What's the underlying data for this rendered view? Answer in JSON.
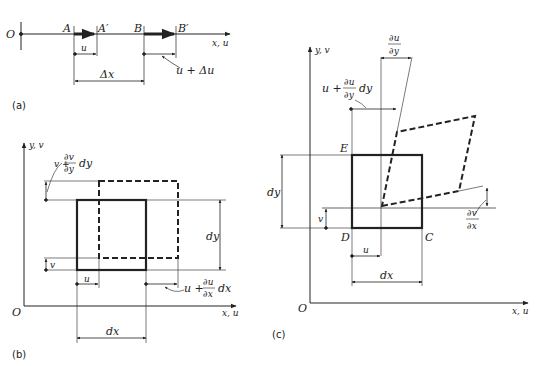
{
  "figure": {
    "panel_a": {
      "caption": "(a)",
      "origin": "O",
      "axis": "x, u",
      "points": [
        "A",
        "A′",
        "B",
        "B′"
      ],
      "disp_u": "u",
      "disp_u_du": "u + Δu",
      "delta_x": "Δx"
    },
    "panel_b": {
      "caption": "(b)",
      "origin": "O",
      "x_axis": "x, u",
      "y_axis": "y, v",
      "v_label": "v",
      "u_label": "u",
      "dx": "dx",
      "dy": "dy",
      "v_plus": "v +",
      "dv": "∂v",
      "dy_den": "∂y",
      "dy_tail": "dy",
      "u_plus": "u +",
      "du": "∂u",
      "dx_den": "∂x",
      "dx_tail": "dx"
    },
    "panel_c": {
      "caption": "(c)",
      "origin": "O",
      "x_axis": "x, u",
      "y_axis": "y, v",
      "E": "E",
      "D": "D",
      "C": "C",
      "u_label": "u",
      "v_label": "v",
      "dx": "dx",
      "dy": "dy",
      "du_dy_num": "∂u",
      "du_dy_den": "∂y",
      "u_plus": "u +",
      "u_plus_num": "∂u",
      "u_plus_den": "∂y",
      "u_plus_tail": "dy",
      "dv_dx_num": "∂v",
      "dv_dx_den": "∂x"
    }
  }
}
